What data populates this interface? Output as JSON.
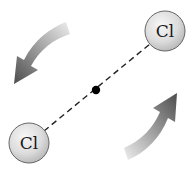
{
  "diagram": {
    "atoms": [
      {
        "label": "Cl",
        "cx": 165,
        "cy": 31,
        "r": 20
      },
      {
        "label": "Cl",
        "cx": 29,
        "cy": 143,
        "r": 20
      }
    ],
    "center_of_mass": {
      "cx": 96,
      "cy": 90,
      "r": 4
    },
    "bond_style": "dashed",
    "arrows": [
      {
        "name": "rotation-arrow-upper-left",
        "direction": "counterclockwise, pointing down-left"
      },
      {
        "name": "rotation-arrow-lower-right",
        "direction": "counterclockwise, pointing up-right"
      }
    ],
    "colors": {
      "atom_fill_light": "#f4f4f4",
      "atom_fill_dark": "#bdbdbd",
      "atom_stroke": "#555555",
      "arrow_dark": "#555555",
      "arrow_light": "#e6e6e6",
      "bond": "#222222"
    }
  }
}
